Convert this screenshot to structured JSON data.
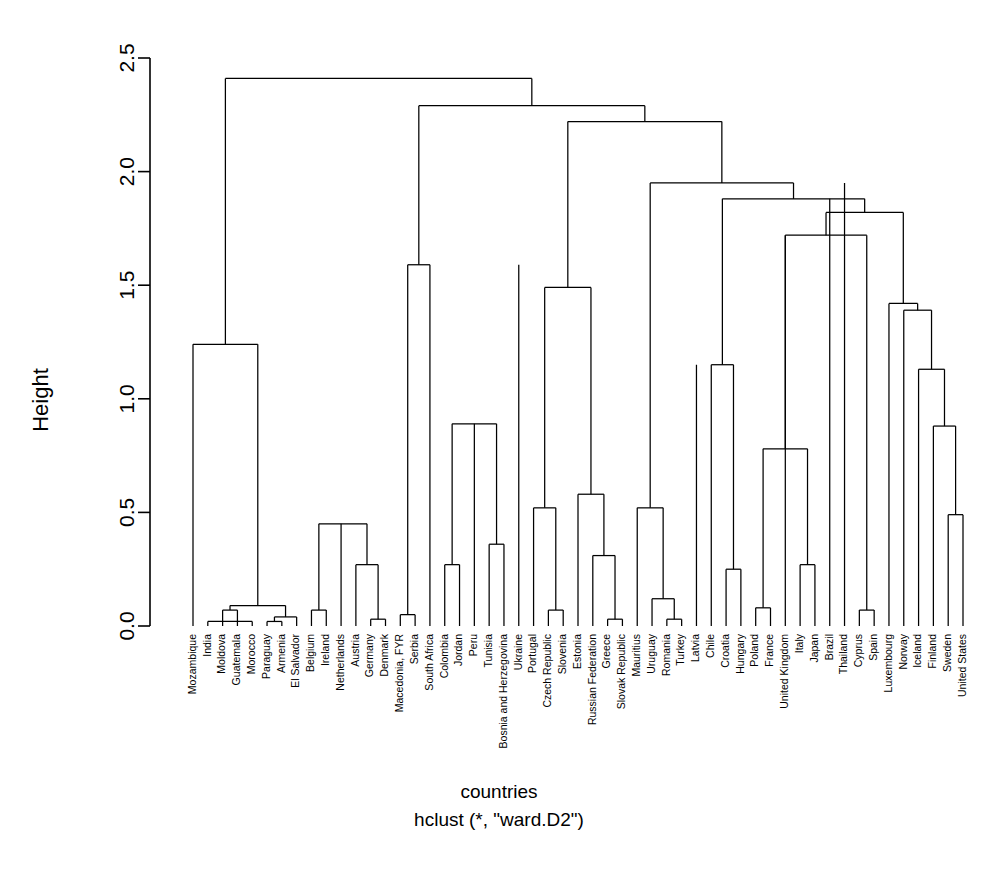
{
  "chart_data": {
    "type": "line",
    "subtype": "dendrogram",
    "title": "",
    "xlabel": "countries",
    "ylabel": "Height",
    "caption": "hclust (*, \"ward.D2\")",
    "method": "ward.D2",
    "ylim": [
      0,
      2.5
    ],
    "yticks": [
      0.0,
      0.5,
      1.0,
      1.5,
      2.0,
      2.5
    ],
    "ytick_labels": [
      "0.0",
      "0.5",
      "1.0",
      "1.5",
      "2.0",
      "2.5"
    ],
    "grid": false,
    "legend": "none",
    "n_leaves": 66,
    "leaf_labels": [
      "Mozambique",
      "India",
      "Moldova",
      "Guatemala",
      "Morocco",
      "Paraguay",
      "Armenia",
      "El Salvador",
      "Belgium",
      "Ireland",
      "Netherlands",
      "Austria",
      "Germany",
      "Denmark",
      "Macedonia, FYR",
      "Serbia",
      "South Africa",
      "Colombia",
      "Jordan",
      "Peru",
      "Tunisia",
      "Bosnia and Herzegovina",
      "Ukraine",
      "Portugal",
      "Czech Republic",
      "Slovenia",
      "Estonia",
      "Russian Federation",
      "Greece",
      "Slovak Republic",
      "Mauritius",
      "Uruguay",
      "Romania",
      "Turkey",
      "Latvia",
      "Chile",
      "Croatia",
      "Hungary",
      "Poland",
      "France",
      "United Kingdom",
      "Italy",
      "Japan",
      "Brazil",
      "Thailand",
      "Cyprus",
      "Spain",
      "Luxembourg",
      "Norway",
      "Iceland",
      "Finland",
      "Sweden",
      "United States"
    ],
    "merges": [
      {
        "id": "m1",
        "height": 0.07,
        "left": {
          "leaf": "Moldova"
        },
        "right": {
          "leaf": "Guatemala"
        }
      },
      {
        "id": "m2",
        "height": 0.02,
        "left": {
          "leaf": "Paraguay"
        },
        "right": {
          "leaf": "Armenia"
        }
      },
      {
        "id": "m3",
        "height": 0.04,
        "left": {
          "ref": "m2"
        },
        "right": {
          "leaf": "El Salvador"
        }
      },
      {
        "id": "m4",
        "height": 0.09,
        "left": {
          "ref": "m1"
        },
        "right": {
          "ref": "m3"
        }
      },
      {
        "id": "m5",
        "height": 0.02,
        "left": {
          "leaf": "India"
        },
        "right": {
          "leaf": "Morocco"
        }
      },
      {
        "id": "m6",
        "height": 1.24,
        "left": {
          "leaf": "Mozambique"
        },
        "right": {
          "ref": "m4"
        }
      },
      {
        "id": "m7",
        "height": 0.07,
        "left": {
          "leaf": "Belgium"
        },
        "right": {
          "leaf": "Ireland"
        }
      },
      {
        "id": "m8",
        "height": 0.03,
        "left": {
          "leaf": "Germany"
        },
        "right": {
          "leaf": "Denmark"
        }
      },
      {
        "id": "m9",
        "height": 0.27,
        "left": {
          "leaf": "Austria"
        },
        "right": {
          "ref": "m8"
        }
      },
      {
        "id": "m10",
        "height": 0.45,
        "left": {
          "ref": "m7"
        },
        "right": {
          "ref": "m9"
        }
      },
      {
        "id": "m11",
        "height": 0.05,
        "left": {
          "leaf": "Macedonia, FYR"
        },
        "right": {
          "leaf": "Serbia"
        }
      },
      {
        "id": "m12",
        "height": 1.59,
        "left": {
          "ref": "m11"
        },
        "right": {
          "leaf": "South Africa"
        }
      },
      {
        "id": "m13",
        "height": 0.27,
        "left": {
          "leaf": "Colombia"
        },
        "right": {
          "leaf": "Jordan"
        }
      },
      {
        "id": "m14",
        "height": 0.36,
        "left": {
          "leaf": "Tunisia"
        },
        "right": {
          "leaf": "Bosnia and Herzegovina"
        }
      },
      {
        "id": "m15",
        "height": 0.89,
        "left": {
          "ref": "m13"
        },
        "right": {
          "ref": "m14"
        }
      },
      {
        "id": "m16",
        "height": 0.07,
        "left": {
          "leaf": "Czech Republic"
        },
        "right": {
          "leaf": "Slovenia"
        }
      },
      {
        "id": "m17",
        "height": 0.52,
        "left": {
          "leaf": "Portugal"
        },
        "right": {
          "ref": "m16"
        }
      },
      {
        "id": "m18",
        "height": 0.03,
        "left": {
          "leaf": "Greece"
        },
        "right": {
          "leaf": "Slovak Republic"
        }
      },
      {
        "id": "m19",
        "height": 0.31,
        "left": {
          "leaf": "Russian Federation"
        },
        "right": {
          "ref": "m18"
        }
      },
      {
        "id": "m20",
        "height": 0.58,
        "left": {
          "leaf": "Estonia"
        },
        "right": {
          "ref": "m19"
        }
      },
      {
        "id": "m21",
        "height": 1.49,
        "left": {
          "ref": "m17"
        },
        "right": {
          "ref": "m20"
        }
      },
      {
        "id": "m22",
        "height": 0.03,
        "left": {
          "leaf": "Romania"
        },
        "right": {
          "leaf": "Turkey"
        }
      },
      {
        "id": "m23",
        "height": 0.12,
        "left": {
          "leaf": "Uruguay"
        },
        "right": {
          "ref": "m22"
        }
      },
      {
        "id": "m24",
        "height": 0.52,
        "left": {
          "leaf": "Mauritius"
        },
        "right": {
          "ref": "m23"
        }
      },
      {
        "id": "m25",
        "height": 0.25,
        "left": {
          "leaf": "Croatia"
        },
        "right": {
          "leaf": "Hungary"
        }
      },
      {
        "id": "m26",
        "height": 1.15,
        "left": {
          "leaf": "Chile"
        },
        "right": {
          "ref": "m25"
        }
      },
      {
        "id": "m27",
        "height": 0.08,
        "left": {
          "leaf": "Poland"
        },
        "right": {
          "leaf": "France"
        }
      },
      {
        "id": "m28",
        "height": 0.27,
        "left": {
          "leaf": "Italy"
        },
        "right": {
          "leaf": "Japan"
        }
      },
      {
        "id": "m29",
        "height": 0.78,
        "left": {
          "ref": "m27"
        },
        "right": {
          "ref": "m28"
        }
      },
      {
        "id": "m30",
        "height": 0.07,
        "left": {
          "leaf": "Cyprus"
        },
        "right": {
          "leaf": "Spain"
        }
      },
      {
        "id": "m31",
        "height": 1.72,
        "left": {
          "ref": "m29"
        },
        "right": {
          "ref": "m30"
        }
      },
      {
        "id": "m32",
        "height": 0.49,
        "left": {
          "leaf": "Sweden"
        },
        "right": {
          "leaf": "United States"
        }
      },
      {
        "id": "m33",
        "height": 0.88,
        "left": {
          "leaf": "Finland"
        },
        "right": {
          "ref": "m32"
        }
      },
      {
        "id": "m34",
        "height": 1.13,
        "left": {
          "leaf": "Iceland"
        },
        "right": {
          "ref": "m33"
        }
      },
      {
        "id": "m35",
        "height": 1.39,
        "left": {
          "leaf": "Norway"
        },
        "right": {
          "ref": "m34"
        }
      },
      {
        "id": "m36",
        "height": 1.42,
        "left": {
          "leaf": "Luxembourg"
        },
        "right": {
          "ref": "m35"
        }
      },
      {
        "id": "m37",
        "height": 1.82,
        "left": {
          "ref": "m31"
        },
        "right": {
          "ref": "m36"
        }
      },
      {
        "id": "m38",
        "height": 1.88,
        "left": {
          "ref": "m26"
        },
        "right": {
          "ref": "m37"
        }
      },
      {
        "id": "m39",
        "height": 1.95,
        "left": {
          "ref": "m24"
        },
        "right": {
          "ref": "m38"
        }
      },
      {
        "id": "m40",
        "height": 2.22,
        "left": {
          "ref": "m21"
        },
        "right": {
          "ref": "m39"
        }
      },
      {
        "id": "m41",
        "height": 2.29,
        "left": {
          "ref": "m12"
        },
        "right": {
          "ref": "m40"
        }
      },
      {
        "id": "m42",
        "height": 0.1,
        "left": {
          "leaf": "Latvia"
        },
        "right": {
          "leaf": "Latvia2"
        }
      },
      {
        "id": "m43",
        "height": 2.41,
        "left": {
          "ref": "m6"
        },
        "right": {
          "ref": "m41"
        }
      }
    ],
    "leaf_order": [
      "Mozambique",
      "India",
      "Moldova",
      "Guatemala",
      "Morocco",
      "Paraguay",
      "Armenia",
      "El Salvador",
      "Belgium",
      "Ireland",
      "Netherlands",
      "Austria",
      "Germany",
      "Denmark",
      "Macedonia, FYR",
      "Serbia",
      "South Africa",
      "Colombia",
      "Jordan",
      "Peru",
      "Tunisia",
      "Bosnia and Herzegovina",
      "Ukraine",
      "Portugal",
      "Czech Republic",
      "Slovenia",
      "Estonia",
      "Russian Federation",
      "Greece",
      "Slovak Republic",
      "Mauritius",
      "Uruguay",
      "Romania",
      "Turkey",
      "Latvia",
      "Chile",
      "Croatia",
      "Hungary",
      "Poland",
      "France",
      "United Kingdom",
      "Italy",
      "Japan",
      "Brazil",
      "Thailand",
      "Cyprus",
      "Spain",
      "Luxembourg",
      "Norway",
      "Iceland",
      "Finland",
      "Sweden",
      "United States"
    ],
    "segments": [
      {
        "x1": 193,
        "x2": 193,
        "y1": 626,
        "y2": 345
      },
      {
        "x1": 193,
        "x2": 285,
        "y1": 345,
        "y2": 345
      },
      {
        "x1": 285,
        "x2": 285,
        "y1": 345,
        "y2": 606
      },
      {
        "x1": 240,
        "x2": 240,
        "y1": 626,
        "y2": 612
      },
      {
        "x1": 240,
        "x2": 273,
        "y1": 612,
        "y2": 612
      },
      {
        "x1": 273,
        "x2": 273,
        "y1": 612,
        "y2": 621
      },
      {
        "x1": 262,
        "x2": 284,
        "y1": 621,
        "y2": 621
      },
      {
        "x1": 262,
        "x2": 262,
        "y1": 621,
        "y2": 626
      },
      {
        "x1": 284,
        "x2": 284,
        "y1": 621,
        "y2": 626
      },
      {
        "x1": 228,
        "x2": 273,
        "y1": 612,
        "y2": 612
      }
    ]
  }
}
